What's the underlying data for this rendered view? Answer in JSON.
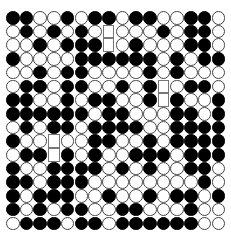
{
  "grid": {
    "rows": 16,
    "cols": 16,
    "colors": {
      "black": "#000000",
      "white": "#ffffff",
      "square_border": "#777777"
    },
    "legend": "B = black circle, W = white circle, R = white square (blank slot)",
    "cells": [
      "BBWWBWBBWBBWWBBW",
      "WBWBWBWRWWWBWBBW",
      "WWBWBBBRWBWWWBBW",
      "BWWWWBBBBBBWBWBB",
      "WWBWBBWWWWBWBWWW",
      "WBBWBBWWBWBRWBBW",
      "BBWWBWBBWWBRBWWB",
      "BBBBBBWBBWWWBBWB",
      "WBWBBWBBBBWWBBBB",
      "BWWRWWBBWWBWBBBB",
      "WBBRBWBWWBBBWBBB",
      "BWWBBBBWBWBWWBBW",
      "BBWBBBWWWWWWWWBW",
      "BWBBBWWBWWBWBBWB",
      "BWBWBBWWBBWWWBWW",
      "WBBBWBBWBBBBBBWW"
    ]
  }
}
